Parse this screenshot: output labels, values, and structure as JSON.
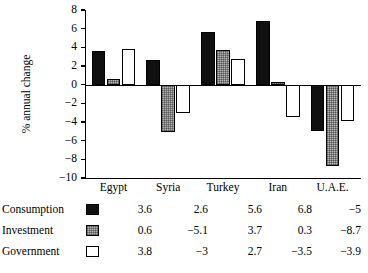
{
  "chart_data": {
    "type": "bar",
    "title": "",
    "xlabel": "",
    "ylabel": "% annual change",
    "categories": [
      "Egypt",
      "Syria",
      "Turkey",
      "Iran",
      "U.A.E."
    ],
    "series": [
      {
        "name": "Consumption",
        "values": [
          3.6,
          2.6,
          5.6,
          6.8,
          -5
        ],
        "color": "#101010",
        "swatch": "black-solid"
      },
      {
        "name": "Investment",
        "values": [
          0.6,
          -5.1,
          3.7,
          0.3,
          -8.7
        ],
        "color": "#b4b4b4",
        "swatch": "gray-stippled"
      },
      {
        "name": "Government",
        "values": [
          3.8,
          -3,
          2.7,
          -3.5,
          -3.9
        ],
        "color": "#ffffff",
        "swatch": "white-outline"
      }
    ],
    "ylim": [
      -10,
      8
    ],
    "ytick_values": [
      8,
      6,
      4,
      2,
      0,
      -2,
      -4,
      -6,
      -8,
      -10
    ],
    "ytick_labels": [
      "8",
      "6",
      "4",
      "2",
      "0",
      "−2",
      "−4",
      "−6",
      "−8",
      "−10"
    ],
    "grid": false,
    "legend_position": "bottom-table",
    "zero_line": true
  },
  "legend_table": {
    "rows": [
      {
        "label": "Consumption",
        "swatch": "black-solid",
        "cells": [
          "3.6",
          "2.6",
          "5.6",
          "6.8",
          "−5"
        ]
      },
      {
        "label": "Investment",
        "swatch": "gray-stippled",
        "cells": [
          "0.6",
          "−5.1",
          "3.7",
          "0.3",
          "−8.7"
        ]
      },
      {
        "label": "Government",
        "swatch": "white-outline",
        "cells": [
          "3.8",
          "−3",
          "2.7",
          "−3.5",
          "−3.9"
        ]
      }
    ]
  }
}
